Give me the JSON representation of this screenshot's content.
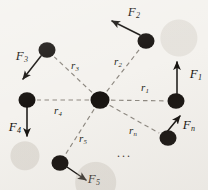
{
  "figure": {
    "background_color": "#f4f2ee",
    "node_color": "#171310",
    "line_color": "#8d8880",
    "arrow_color": "#15120f",
    "width": 208,
    "height": 190,
    "ellipsis": "···",
    "ellipsis_position": {
      "x": 124,
      "y": 156
    }
  },
  "center_particle": {
    "label": "central-particle",
    "x": 100,
    "y": 100,
    "r": 9.5
  },
  "particles": [
    {
      "id": "p1",
      "x": 176,
      "y": 101,
      "r": 8.5,
      "force_label": "F",
      "force_sub": "1",
      "force_label_x": 196,
      "force_label_y": 75,
      "force_tail_x": 177,
      "force_tail_y": 94,
      "force_head_x": 177,
      "force_head_y": 62,
      "dist_label": "r",
      "dist_sub": "1",
      "dist_label_x": 145,
      "dist_label_y": 88
    },
    {
      "id": "p2",
      "x": 146,
      "y": 41,
      "r": 8.5,
      "force_label": "F",
      "force_sub": "2",
      "force_label_x": 134,
      "force_label_y": 13,
      "force_tail_x": 140,
      "force_tail_y": 35,
      "force_head_x": 112,
      "force_head_y": 21,
      "dist_label": "r",
      "dist_sub": "2",
      "dist_label_x": 118,
      "dist_label_y": 62
    },
    {
      "id": "p3",
      "x": 47,
      "y": 50,
      "r": 8.5,
      "force_label": "F",
      "force_sub": "3",
      "force_label_x": 22,
      "force_label_y": 57,
      "force_tail_x": 41,
      "force_tail_y": 56,
      "force_head_x": 23,
      "force_head_y": 79,
      "dist_label": "r",
      "dist_sub": "3",
      "dist_label_x": 75,
      "dist_label_y": 66
    },
    {
      "id": "p4",
      "x": 27,
      "y": 100,
      "r": 8.5,
      "force_label": "F",
      "force_sub": "4",
      "force_label_x": 15,
      "force_label_y": 128,
      "force_tail_x": 27,
      "force_tail_y": 107,
      "force_head_x": 27,
      "force_head_y": 136,
      "dist_label": "r",
      "dist_sub": "4",
      "dist_label_x": 58,
      "dist_label_y": 111
    },
    {
      "id": "p5",
      "x": 60,
      "y": 163,
      "r": 8.5,
      "force_label": "F",
      "force_sub": "5",
      "force_label_x": 94,
      "force_label_y": 180,
      "force_tail_x": 67,
      "force_tail_y": 167,
      "force_head_x": 86,
      "force_head_y": 180,
      "dist_label": "r",
      "dist_sub": "5",
      "dist_label_x": 83,
      "dist_label_y": 139
    },
    {
      "id": "pn",
      "x": 168,
      "y": 138,
      "r": 8.5,
      "force_label": "F",
      "force_sub": "n",
      "force_label_x": 189,
      "force_label_y": 126,
      "force_tail_x": 166,
      "force_tail_y": 133,
      "force_head_x": 180,
      "force_head_y": 116,
      "dist_label": "r",
      "dist_sub": "n",
      "dist_label_x": 133,
      "dist_label_y": 131
    }
  ]
}
